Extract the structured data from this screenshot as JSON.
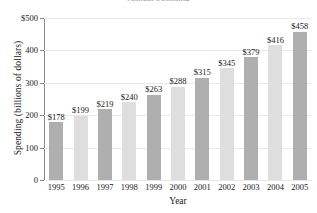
{
  "chart_data": {
    "type": "bar",
    "title": "Annual Spending",
    "xlabel": "Year",
    "ylabel": "Spending (billions of dollars)",
    "categories": [
      "1995",
      "1996",
      "1997",
      "1998",
      "1999",
      "2000",
      "2001",
      "2002",
      "2003",
      "2004",
      "2005"
    ],
    "values": [
      178,
      199,
      219,
      240,
      263,
      288,
      315,
      345,
      379,
      416,
      458
    ],
    "value_labels": [
      "$178",
      "$199",
      "$219",
      "$240",
      "$263",
      "$288",
      "$315",
      "$345",
      "$379",
      "$416",
      "$458"
    ],
    "ylim": [
      0,
      500
    ],
    "yticks": [
      0,
      100,
      200,
      300,
      400,
      500
    ],
    "ytick_labels": [
      "0",
      "100",
      "200",
      "300",
      "400",
      "$500"
    ],
    "grid": true,
    "legend": "none",
    "bar_colors": [
      "#afafaf",
      "#dedede",
      "#afafaf",
      "#dedede",
      "#afafaf",
      "#dedede",
      "#afafaf",
      "#dedede",
      "#afafaf",
      "#dedede",
      "#afafaf"
    ],
    "colors": {
      "bar_dark": "#afafaf",
      "bar_light": "#dedede",
      "axis": "#8a8a8a",
      "gridline": "#e9e9e9",
      "text": "#1a1a1a",
      "background": "#ffffff"
    }
  }
}
